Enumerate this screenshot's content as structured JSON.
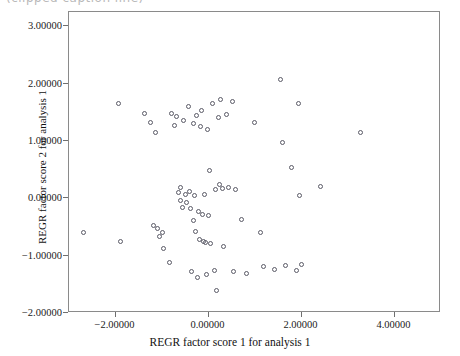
{
  "top_caption": {
    "text": "(clipped caption line)"
  },
  "chart_data": {
    "type": "scatter",
    "title": "",
    "xlabel": "REGR factor score 1 for analysis 1",
    "ylabel": "REGR factor score 2 for analysis 1",
    "xlim": [
      -3.0,
      5.0
    ],
    "ylim": [
      -2.0,
      3.25
    ],
    "grid": false,
    "legend": null,
    "marker": "open-circle",
    "marker_color": "#5a5a66",
    "xticks": [
      -2.0,
      0.0,
      2.0,
      4.0
    ],
    "xtick_labels": [
      "-2.00000",
      "0.00000",
      "2.00000",
      "4.00000"
    ],
    "yticks": [
      3.0,
      2.0,
      1.0,
      0.0,
      -1.0,
      -2.0
    ],
    "ytick_labels": [
      "3.00000",
      "2.00000",
      "1.00000",
      "0.00000",
      "-1.00000",
      "-2.00000"
    ],
    "points": [
      {
        "x": -2.65,
        "y": -0.62
      },
      {
        "x": -1.9,
        "y": 1.62
      },
      {
        "x": -1.86,
        "y": -0.78
      },
      {
        "x": -1.34,
        "y": 1.45
      },
      {
        "x": -1.22,
        "y": 1.3
      },
      {
        "x": -1.16,
        "y": -0.5
      },
      {
        "x": -1.1,
        "y": 1.12
      },
      {
        "x": -1.06,
        "y": -0.56
      },
      {
        "x": -1.02,
        "y": -0.7
      },
      {
        "x": -0.96,
        "y": -0.62
      },
      {
        "x": -0.93,
        "y": -0.9
      },
      {
        "x": -0.8,
        "y": -1.15
      },
      {
        "x": -0.76,
        "y": 1.46
      },
      {
        "x": -0.7,
        "y": 1.25
      },
      {
        "x": -0.66,
        "y": 1.4
      },
      {
        "x": -0.62,
        "y": 0.08
      },
      {
        "x": -0.58,
        "y": 0.16
      },
      {
        "x": -0.56,
        "y": -0.06
      },
      {
        "x": -0.52,
        "y": -0.18
      },
      {
        "x": -0.5,
        "y": 1.34
      },
      {
        "x": -0.46,
        "y": 0.04
      },
      {
        "x": -0.44,
        "y": -0.1
      },
      {
        "x": -0.4,
        "y": 1.58
      },
      {
        "x": -0.38,
        "y": 0.1
      },
      {
        "x": -0.36,
        "y": -0.2
      },
      {
        "x": -0.34,
        "y": -1.3
      },
      {
        "x": -0.3,
        "y": -0.42
      },
      {
        "x": -0.28,
        "y": 1.28
      },
      {
        "x": -0.26,
        "y": 0.02
      },
      {
        "x": -0.24,
        "y": -0.6
      },
      {
        "x": -0.22,
        "y": 1.42
      },
      {
        "x": -0.2,
        "y": -1.4
      },
      {
        "x": -0.18,
        "y": -0.26
      },
      {
        "x": -0.16,
        "y": -0.75
      },
      {
        "x": -0.14,
        "y": 1.22
      },
      {
        "x": -0.12,
        "y": 1.5
      },
      {
        "x": -0.1,
        "y": -0.3
      },
      {
        "x": -0.08,
        "y": -0.78
      },
      {
        "x": -0.06,
        "y": 0.04
      },
      {
        "x": -0.04,
        "y": -0.8
      },
      {
        "x": -0.02,
        "y": -1.36
      },
      {
        "x": 0.02,
        "y": 1.18
      },
      {
        "x": 0.04,
        "y": -0.32
      },
      {
        "x": 0.06,
        "y": 0.46
      },
      {
        "x": 0.08,
        "y": -0.82
      },
      {
        "x": 0.12,
        "y": 1.62
      },
      {
        "x": 0.16,
        "y": -1.28
      },
      {
        "x": 0.18,
        "y": 0.12
      },
      {
        "x": 0.2,
        "y": -1.64
      },
      {
        "x": 0.24,
        "y": 1.38
      },
      {
        "x": 0.26,
        "y": 0.22
      },
      {
        "x": 0.3,
        "y": 1.7
      },
      {
        "x": 0.34,
        "y": 0.14
      },
      {
        "x": 0.36,
        "y": -0.86
      },
      {
        "x": 0.42,
        "y": 1.44
      },
      {
        "x": 0.46,
        "y": 0.16
      },
      {
        "x": 0.54,
        "y": 1.66
      },
      {
        "x": 0.58,
        "y": -1.3
      },
      {
        "x": 0.62,
        "y": 0.12
      },
      {
        "x": 0.74,
        "y": -0.4
      },
      {
        "x": 0.86,
        "y": -1.34
      },
      {
        "x": 1.02,
        "y": 1.3
      },
      {
        "x": 1.14,
        "y": -0.62
      },
      {
        "x": 1.22,
        "y": -1.22
      },
      {
        "x": 1.46,
        "y": -1.26
      },
      {
        "x": 1.58,
        "y": 2.05
      },
      {
        "x": 1.62,
        "y": 0.94
      },
      {
        "x": 1.68,
        "y": -1.2
      },
      {
        "x": 1.82,
        "y": 0.52
      },
      {
        "x": 1.92,
        "y": -1.28
      },
      {
        "x": 1.96,
        "y": 1.62
      },
      {
        "x": 1.98,
        "y": 0.02
      },
      {
        "x": 2.04,
        "y": -1.18
      },
      {
        "x": 2.44,
        "y": 0.18
      },
      {
        "x": 3.3,
        "y": 1.12
      }
    ]
  }
}
